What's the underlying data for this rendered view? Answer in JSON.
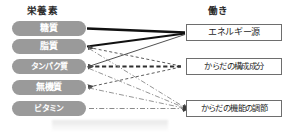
{
  "diagram": {
    "title_left": "栄養素",
    "title_right": "働き",
    "nutrients": [
      {
        "label": "糖質"
      },
      {
        "label": "脂質"
      },
      {
        "label": "タンパク質"
      },
      {
        "label": "無機質"
      },
      {
        "label": "ビタミン"
      }
    ],
    "functions": [
      {
        "label": "エネルギー源"
      },
      {
        "label": "からだの構成成分"
      },
      {
        "label": "からだの機能の調節"
      }
    ],
    "colors": {
      "pill_fill": "#9a9a9a",
      "pill_text": "#ffffff",
      "box_border": "#6e6e6e",
      "box_text": "#1f1f1f",
      "heading_text": "#2b2b2b",
      "edge_solid": "#111111",
      "edge_dashed": "#3a3a3a",
      "edge_dashdot": "#7d7d7d"
    },
    "edges": [
      {
        "from": "糖質",
        "to": "エネルギー源",
        "style": "solid-thick"
      },
      {
        "from": "脂質",
        "to": "エネルギー源",
        "style": "solid-thick"
      },
      {
        "from": "タンパク質",
        "to": "エネルギー源",
        "style": "solid-thin"
      },
      {
        "from": "脂質",
        "to": "からだの構成成分",
        "style": "dashed"
      },
      {
        "from": "タンパク質",
        "to": "からだの構成成分",
        "style": "dashed-thick"
      },
      {
        "from": "無機質",
        "to": "からだの構成成分",
        "style": "dashed"
      },
      {
        "from": "脂質",
        "to": "からだの機能の調節",
        "style": "dashdot"
      },
      {
        "from": "タンパク質",
        "to": "からだの機能の調節",
        "style": "dashdot"
      },
      {
        "from": "無機質",
        "to": "からだの機能の調節",
        "style": "dashdot"
      },
      {
        "from": "ビタミン",
        "to": "からだの機能の調節",
        "style": "dashdot"
      }
    ]
  }
}
